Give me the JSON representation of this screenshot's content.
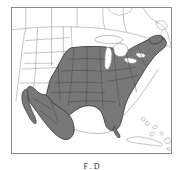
{
  "figure": {
    "kind": "range-distribution-map",
    "region_title": "North America",
    "caption": "Figure 1. Distribution",
    "caption_visible_fragment": "F        .  D"
  },
  "map": {
    "frame": {
      "x": 11,
      "y": 7,
      "width": 161,
      "height": 147,
      "border_color": "#8a8a8a",
      "background_color": "#ffffff"
    },
    "projection_note": "conic, curved parallels",
    "colors": {
      "shaded_range_fill": "#787878",
      "shaded_range_border": "#3a3a3a",
      "internal_state_line": "#555555",
      "unshaded_land_line": "#9a9a9a",
      "coastline": "#8f8f8f",
      "water": "#ffffff",
      "lake_fill": "#ffffff"
    },
    "legend": {
      "shaded_label": "Shaded: species range",
      "unshaded_label": "Unshaded: outside range"
    },
    "shaded_areas": [
      "Eastern United States",
      "Midwest United States",
      "Great Plains (eastern portion)",
      "Texas",
      "Florida",
      "New England",
      "Mexico (mainland)",
      "Baja California"
    ],
    "unshaded_areas": [
      "Western United States",
      "Canada",
      "Cuba",
      "Bahamas",
      "Hispaniola",
      "Great Lakes"
    ],
    "water_bodies": [
      "Atlantic Ocean",
      "Gulf of Mexico",
      "Pacific Ocean",
      "Lake Michigan",
      "Lake Huron",
      "Lake Superior",
      "Lake Erie",
      "Lake Ontario",
      "Caribbean Sea"
    ]
  }
}
